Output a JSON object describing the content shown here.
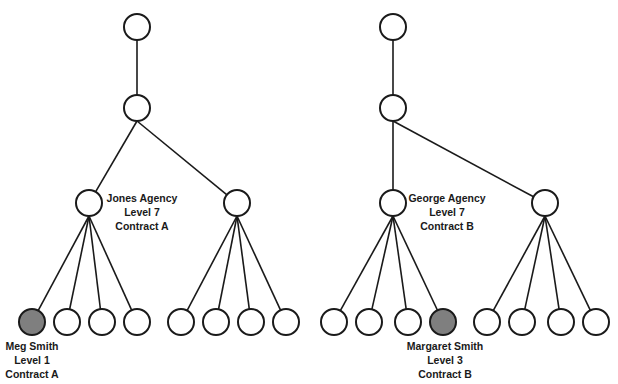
{
  "colors": {
    "stroke": "#1a1a1a",
    "highlight_fill": "#7f7f7f",
    "background": "#ffffff"
  },
  "trees": [
    {
      "root": {
        "x": 137,
        "y": 27
      },
      "level2": {
        "x": 137,
        "y": 108
      },
      "agencies": [
        {
          "x": 89,
          "y": 203,
          "label": [
            "Jones Agency",
            "Level 7",
            "Contract A"
          ],
          "children": [
            {
              "x": 32,
              "y": 322,
              "highlight": true,
              "label": [
                "Meg Smith",
                "Level 1",
                "Contract A"
              ]
            },
            {
              "x": 67,
              "y": 322
            },
            {
              "x": 102,
              "y": 322
            },
            {
              "x": 137,
              "y": 322
            }
          ]
        },
        {
          "x": 237,
          "y": 203,
          "children": [
            {
              "x": 181,
              "y": 322
            },
            {
              "x": 216,
              "y": 322
            },
            {
              "x": 251,
              "y": 322
            },
            {
              "x": 286,
              "y": 322
            }
          ]
        }
      ]
    },
    {
      "root": {
        "x": 393,
        "y": 27
      },
      "level2": {
        "x": 393,
        "y": 108
      },
      "agencies": [
        {
          "x": 393,
          "y": 203,
          "label": [
            "George Agency",
            "Level 7",
            "Contract B"
          ],
          "children": [
            {
              "x": 334,
              "y": 322
            },
            {
              "x": 369,
              "y": 322
            },
            {
              "x": 408,
              "y": 322
            },
            {
              "x": 443,
              "y": 322,
              "highlight": true,
              "label": [
                "Margaret Smith",
                "Level 3",
                "Contract B"
              ]
            }
          ]
        },
        {
          "x": 545,
          "y": 203,
          "children": [
            {
              "x": 487,
              "y": 322
            },
            {
              "x": 522,
              "y": 322
            },
            {
              "x": 561,
              "y": 322
            },
            {
              "x": 596,
              "y": 322
            }
          ]
        }
      ]
    }
  ],
  "labels": {
    "jones": {
      "line1": "Jones Agency",
      "line2": "Level 7",
      "line3": "Contract A"
    },
    "george": {
      "line1": "George Agency",
      "line2": "Level 7",
      "line3": "Contract B"
    },
    "meg": {
      "line1": "Meg Smith",
      "line2": "Level 1",
      "line3": "Contract A"
    },
    "margaret": {
      "line1": "Margaret Smith",
      "line2": "Level 3",
      "line3": "Contract B"
    }
  },
  "node_radius": 13
}
